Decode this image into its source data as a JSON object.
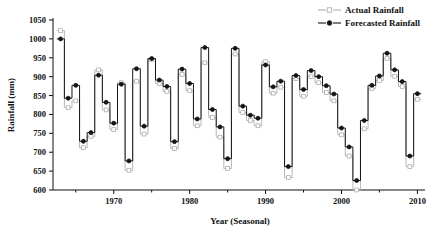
{
  "chart_data": {
    "type": "line",
    "title": "",
    "xlabel": "Year (Seasonal)",
    "ylabel": "Rainfall (mm)",
    "xlim": [
      1962,
      2011
    ],
    "ylim": [
      600,
      1050
    ],
    "ytick_values": [
      600,
      650,
      700,
      750,
      800,
      850,
      900,
      950,
      1000,
      1050
    ],
    "xtick_values": [
      1970,
      1980,
      1990,
      2000,
      2010
    ],
    "xtick_labels": [
      "1970",
      "1980",
      "1990",
      "2000",
      "2010"
    ],
    "ytick_labels": [
      "600",
      "650",
      "700",
      "750",
      "800",
      "850",
      "900",
      "950",
      "1000",
      "1050"
    ],
    "x_minor_ticks": [
      1965,
      1975,
      1985,
      1995,
      2005
    ],
    "grid": false,
    "legend_position": "top-right",
    "drawstyle": "steps-mid",
    "x": [
      1963,
      1964,
      1965,
      1966,
      1967,
      1968,
      1969,
      1970,
      1971,
      1972,
      1973,
      1974,
      1975,
      1976,
      1977,
      1978,
      1979,
      1980,
      1981,
      1982,
      1983,
      1984,
      1985,
      1986,
      1987,
      1988,
      1989,
      1990,
      1991,
      1992,
      1993,
      1994,
      1995,
      1996,
      1997,
      1998,
      1999,
      2000,
      2001,
      2002,
      2003,
      2004,
      2005,
      2006,
      2007,
      2008,
      2009,
      2010
    ],
    "series": [
      {
        "name": "Actual Rainfall",
        "color": "#b0b0b0",
        "marker": "square",
        "values": [
          1022,
          818,
          836,
          712,
          742,
          918,
          812,
          760,
          884,
          652,
          888,
          748,
          945,
          882,
          861,
          710,
          906,
          863,
          770,
          937,
          792,
          740,
          657,
          960,
          805,
          784,
          770,
          940,
          856,
          872,
          633,
          895,
          848,
          900,
          884,
          858,
          836,
          746,
          690,
          600,
          762,
          869,
          890,
          948,
          901,
          874,
          662,
          840
        ]
      },
      {
        "name": "Forecasted Rainfall",
        "color": "#141414",
        "marker": "circle",
        "values": [
          1000,
          843,
          877,
          729,
          752,
          904,
          832,
          777,
          880,
          677,
          921,
          769,
          948,
          891,
          874,
          728,
          920,
          882,
          788,
          977,
          813,
          767,
          683,
          975,
          822,
          798,
          790,
          931,
          873,
          888,
          662,
          903,
          866,
          916,
          900,
          876,
          854,
          764,
          714,
          625,
          784,
          877,
          902,
          962,
          918,
          887,
          690,
          855
        ]
      }
    ]
  },
  "legend": {
    "items": [
      {
        "label": "Actual Rainfall"
      },
      {
        "label": "Forecasted Rainfall"
      }
    ]
  }
}
